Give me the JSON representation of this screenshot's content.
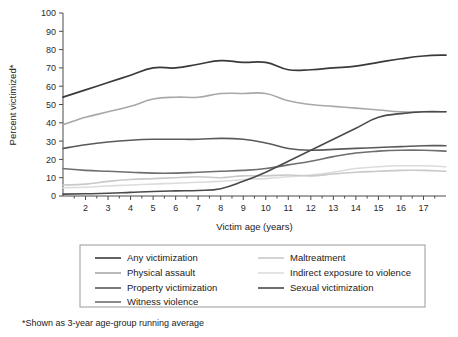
{
  "chart_data": {
    "type": "line",
    "title": "",
    "xlabel": "Victim age (years)",
    "ylabel": "Percent victimized*",
    "xlim": [
      1,
      18
    ],
    "ylim": [
      0,
      100
    ],
    "grid": false,
    "legend_position": "bottom",
    "x": [
      1,
      2,
      3,
      4,
      5,
      6,
      7,
      8,
      9,
      10,
      11,
      12,
      13,
      14,
      15,
      16,
      17,
      18
    ],
    "xticks": [
      "2",
      "3",
      "4",
      "5",
      "6",
      "7",
      "8",
      "9",
      "10",
      "11",
      "12",
      "13",
      "14",
      "15",
      "16",
      "17"
    ],
    "yticks": [
      "0",
      "10",
      "20",
      "30",
      "40",
      "50",
      "60",
      "70",
      "80",
      "90",
      "100"
    ],
    "series": [
      {
        "name": "Any victimization",
        "color": "#3a3a3a",
        "width": 1.7,
        "values": [
          54,
          58,
          62,
          66,
          70,
          70,
          72,
          74,
          73,
          73,
          69,
          69,
          70,
          71,
          73,
          75,
          76.5,
          77
        ]
      },
      {
        "name": "Physical assault",
        "color": "#a8a8a8",
        "width": 1.6,
        "values": [
          39,
          43,
          46,
          49,
          53,
          54,
          54,
          56,
          56,
          56,
          52,
          50,
          49,
          48,
          47,
          46,
          46,
          46
        ]
      },
      {
        "name": "Property victimization",
        "color": "#5a5a5a",
        "width": 1.6,
        "values": [
          26,
          28,
          29.5,
          30.5,
          31,
          31,
          31,
          31.5,
          31,
          29,
          26,
          25,
          25.5,
          26,
          26.5,
          27,
          27.5,
          27.5
        ]
      },
      {
        "name": "Witness violence",
        "color": "#6e6e6e",
        "width": 1.6,
        "values": [
          15,
          14,
          13.5,
          13,
          12.5,
          12.5,
          13,
          13.5,
          14,
          15,
          17,
          19,
          21.5,
          23.5,
          24.5,
          25,
          25,
          24.5
        ]
      },
      {
        "name": "Maltreatment",
        "color": "#c9c9c9",
        "width": 1.6,
        "values": [
          6,
          6.5,
          8,
          9,
          9.5,
          10,
          10.5,
          10,
          11,
          11,
          11.5,
          11,
          12,
          13,
          13.5,
          14,
          14,
          13.5
        ]
      },
      {
        "name": "Indirect exposure to violence",
        "color": "#dcdcdc",
        "width": 1.6,
        "values": [
          4.5,
          4.8,
          5.5,
          6,
          6.5,
          7,
          7.5,
          8,
          9,
          9.5,
          10.5,
          11.5,
          13,
          15,
          16,
          16.5,
          16.5,
          16
        ]
      },
      {
        "name": "Sexual victimization",
        "color": "#4a4a4a",
        "width": 1.6,
        "values": [
          1,
          1.2,
          1.5,
          2,
          2.5,
          2.8,
          3,
          4,
          8,
          13,
          19,
          25,
          31,
          37,
          43,
          45,
          46,
          46
        ]
      }
    ]
  },
  "legend": {
    "entries": [
      {
        "label": "Any victimization",
        "color": "#3a3a3a",
        "column": 0,
        "row": 0
      },
      {
        "label": "Physical assault",
        "color": "#a8a8a8",
        "column": 0,
        "row": 1
      },
      {
        "label": "Property victimization",
        "color": "#5a5a5a",
        "column": 0,
        "row": 2
      },
      {
        "label": "Witness violence",
        "color": "#6e6e6e",
        "column": 0,
        "row": 3
      },
      {
        "label": "Maltreatment",
        "color": "#c9c9c9",
        "column": 1,
        "row": 0
      },
      {
        "label": "Indirect exposure to violence",
        "color": "#dcdcdc",
        "column": 1,
        "row": 1
      },
      {
        "label": "Sexual victimization",
        "color": "#4a4a4a",
        "column": 1,
        "row": 2
      }
    ]
  },
  "footnote": {
    "text": "*Shown as 3-year age-group running average"
  }
}
